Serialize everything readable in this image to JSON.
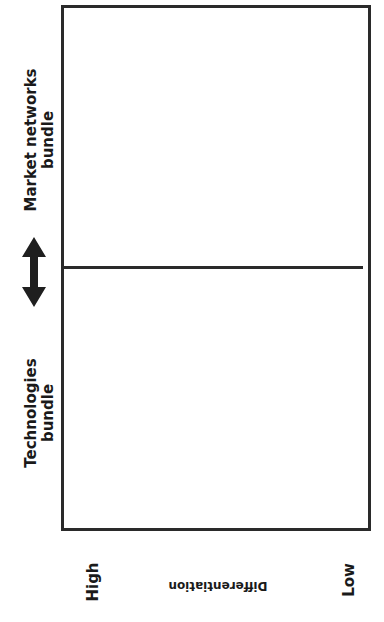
{
  "diagram": {
    "upper_region_label": {
      "line1": "Market networks",
      "line2": "bundle"
    },
    "lower_region_label": {
      "line1": "Technologies",
      "line2": "bundle"
    },
    "divider_icon": "double-headed-vertical-arrow",
    "axis": {
      "title": "Differentiation",
      "left_end": "High",
      "right_end": "Low"
    },
    "colors": {
      "line": "#2a2a2a",
      "text": "#1a1a1a",
      "background": "#ffffff"
    }
  }
}
